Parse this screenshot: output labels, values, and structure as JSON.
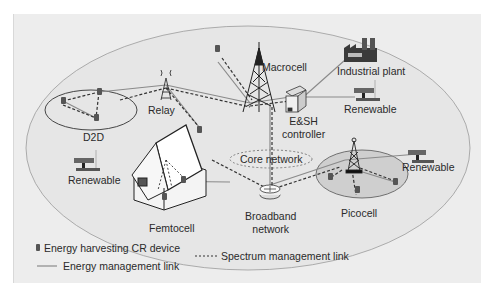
{
  "figure": {
    "nodes": {
      "macrocell": "Macrocell",
      "industrial_plant": "Industrial plant",
      "renewable_top_right": "Renewable",
      "esh_controller_line1": "E&SH",
      "esh_controller_line2": "controller",
      "relay": "Relay",
      "d2d": "D2D",
      "renewable_left": "Renewable",
      "core_network": "Core network",
      "femtocell": "Femtocell",
      "broadband_line1": "Broadband",
      "broadband_line2": "network",
      "picocell": "Picocell",
      "renewable_right": "Renewable"
    },
    "legend": {
      "device": "Energy harvesting CR device",
      "energy_link": "Energy management link",
      "spectrum_link": "Spectrum management link"
    },
    "icons": {
      "device": "energy-harvesting-device-icon",
      "tower": "cell-tower-icon",
      "factory": "factory-icon",
      "solar": "solar-panel-icon",
      "server": "server-icon",
      "router": "router-icon",
      "house": "house-icon"
    },
    "colors": {
      "panel_bg": "#ededed",
      "ellipse_fill": "#e4e4e4",
      "ellipse_stroke": "#9a9a9a",
      "energy_link": "#8a8a8a",
      "spectrum_link": "#333333",
      "text": "#2a2a2a"
    }
  }
}
